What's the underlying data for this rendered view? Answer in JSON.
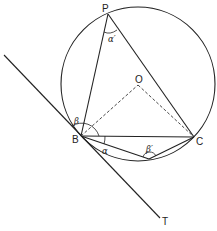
{
  "diagram": {
    "type": "geometry-circle-tangent",
    "points": {
      "P": {
        "label": "P",
        "x": 108,
        "y": 14
      },
      "O": {
        "label": "O",
        "x": 138,
        "y": 85
      },
      "B": {
        "label": "B",
        "x": 81,
        "y": 136
      },
      "C": {
        "label": "C",
        "x": 194,
        "y": 137
      },
      "D": {
        "x": 149,
        "y": 159
      },
      "T": {
        "label": "T",
        "x": 160,
        "y": 218
      }
    },
    "circle": {
      "cx": 138,
      "cy": 84,
      "r": 77
    },
    "angles": {
      "alpha_prime": "α′",
      "beta": "β",
      "alpha": "α",
      "beta_prime": "β′"
    },
    "colors": {
      "stroke": "#222222",
      "background": "#ffffff"
    }
  }
}
